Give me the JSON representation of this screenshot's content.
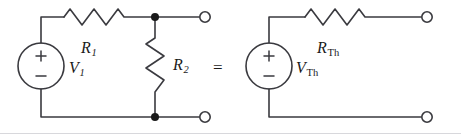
{
  "figure": {
    "type": "circuit-diagram",
    "background_color": "#ffffff",
    "line_color": "#3a3a3f",
    "text_color": "#1a1a1a"
  },
  "relation": {
    "equals_sign": "="
  },
  "left_circuit": {
    "name": "original-circuit",
    "source": {
      "type": "voltage-source",
      "plus": "+",
      "minus": "−",
      "label_main": "V",
      "label_sub": "1"
    },
    "series_resistor": {
      "label_main": "R",
      "label_sub": "1"
    },
    "shunt_resistor": {
      "label_main": "R",
      "label_sub": "2"
    },
    "terminals": {
      "top": "open-terminal",
      "bottom": "open-terminal"
    },
    "nodes": {
      "top": "junction-dot",
      "bottom": "junction-dot"
    }
  },
  "right_circuit": {
    "name": "thevenin-equivalent-circuit",
    "source": {
      "type": "voltage-source",
      "plus": "+",
      "minus": "−",
      "label_main": "V",
      "label_sub": "Th"
    },
    "series_resistor": {
      "label_main": "R",
      "label_sub": "Th"
    },
    "terminals": {
      "top": "open-terminal",
      "bottom": "open-terminal"
    }
  }
}
